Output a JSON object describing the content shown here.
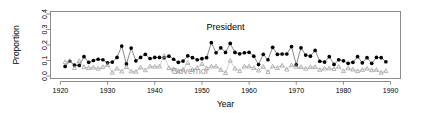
{
  "chart_data": {
    "type": "line",
    "title": "",
    "xlabel": "Year",
    "ylabel": "Proportion",
    "xlim": [
      1920,
      1990
    ],
    "ylim": [
      0.0,
      0.4
    ],
    "grid": false,
    "legend_position": "inline-annotations",
    "xticks": [
      1920,
      1930,
      1940,
      1950,
      1960,
      1970,
      1980,
      1990
    ],
    "xtick_labels": [
      "1920",
      "1930",
      "1940",
      "1950",
      "1960",
      "1970",
      "1980",
      "1990"
    ],
    "yticks": [
      0.0,
      0.1,
      0.2,
      0.3,
      0.4
    ],
    "ytick_labels": [
      "0.0",
      "0.1",
      "0.2",
      "0.3",
      "0.4"
    ],
    "annotations": [
      {
        "text": "President",
        "x": 1955.0,
        "y": 0.295,
        "color": "#000000"
      },
      {
        "text": "Governor",
        "x": 1947.5,
        "y": 0.012,
        "color": "#9a9a9a"
      }
    ],
    "series": [
      {
        "name": "President",
        "color": "#000000",
        "marker": "filled-circle",
        "x": [
          1921,
          1922,
          1923,
          1924,
          1925,
          1926,
          1927,
          1928,
          1929,
          1930,
          1931,
          1932,
          1933,
          1934,
          1935,
          1936,
          1937,
          1938,
          1939,
          1940,
          1941,
          1942,
          1943,
          1944,
          1945,
          1946,
          1947,
          1948,
          1949,
          1950,
          1951,
          1952,
          1953,
          1954,
          1955,
          1956,
          1957,
          1958,
          1959,
          1960,
          1961,
          1962,
          1963,
          1964,
          1965,
          1966,
          1967,
          1968,
          1969,
          1970,
          1971,
          1972,
          1973,
          1974,
          1975,
          1976,
          1977,
          1978,
          1979,
          1980,
          1981,
          1982,
          1983,
          1984,
          1985,
          1986,
          1987,
          1988,
          1989
        ],
        "y": [
          0.062,
          0.095,
          0.07,
          0.068,
          0.125,
          0.088,
          0.1,
          0.108,
          0.105,
          0.085,
          0.09,
          0.12,
          0.193,
          0.078,
          0.18,
          0.098,
          0.12,
          0.14,
          0.113,
          0.12,
          0.12,
          0.118,
          0.128,
          0.108,
          0.088,
          0.096,
          0.13,
          0.118,
          0.105,
          0.112,
          0.118,
          0.215,
          0.15,
          0.182,
          0.152,
          0.21,
          0.152,
          0.143,
          0.15,
          0.153,
          0.128,
          0.074,
          0.14,
          0.105,
          0.185,
          0.14,
          0.142,
          0.142,
          0.19,
          0.072,
          0.182,
          0.135,
          0.128,
          0.165,
          0.095,
          0.09,
          0.125,
          0.075,
          0.105,
          0.098,
          0.082,
          0.088,
          0.125,
          0.085,
          0.118,
          0.082,
          0.12,
          0.118,
          0.092
        ]
      },
      {
        "name": "Governor",
        "color": "#9a9a9a",
        "marker": "open-triangle",
        "x": [
          1921,
          1922,
          1923,
          1924,
          1925,
          1926,
          1927,
          1928,
          1929,
          1930,
          1931,
          1932,
          1933,
          1934,
          1935,
          1936,
          1937,
          1938,
          1939,
          1940,
          1941,
          1942,
          1943,
          1944,
          1945,
          1946,
          1947,
          1948,
          1949,
          1950,
          1951,
          1952,
          1953,
          1954,
          1955,
          1956,
          1957,
          1958,
          1959,
          1960,
          1961,
          1962,
          1963,
          1964,
          1965,
          1966,
          1967,
          1968,
          1969,
          1970,
          1971,
          1972,
          1973,
          1974,
          1975,
          1976,
          1977,
          1978,
          1979,
          1980,
          1981,
          1982,
          1983,
          1984,
          1985,
          1986,
          1987,
          1988,
          1989
        ],
        "y": [
          0.09,
          0.098,
          0.052,
          0.098,
          0.058,
          0.052,
          0.055,
          0.048,
          0.058,
          0.072,
          0.022,
          0.048,
          0.03,
          0.058,
          0.03,
          0.028,
          0.055,
          0.038,
          0.062,
          0.06,
          0.062,
          0.13,
          0.052,
          0.045,
          0.03,
          0.042,
          0.085,
          0.04,
          0.052,
          0.078,
          0.05,
          0.062,
          0.062,
          0.04,
          0.02,
          0.1,
          0.048,
          0.032,
          0.062,
          0.062,
          0.052,
          0.036,
          0.06,
          0.026,
          0.062,
          0.052,
          0.068,
          0.042,
          0.07,
          0.06,
          0.058,
          0.048,
          0.058,
          0.058,
          0.04,
          0.048,
          0.05,
          0.045,
          0.06,
          0.032,
          0.05,
          0.042,
          0.032,
          0.04,
          0.048,
          0.038,
          0.04,
          0.022,
          0.032
        ]
      }
    ]
  },
  "figure": {
    "background_color": "#ffffff",
    "axis_color": "#808080"
  }
}
